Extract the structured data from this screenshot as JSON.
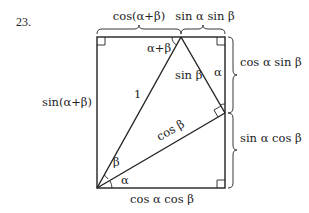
{
  "problem_number": "23.",
  "labels": {
    "top_left": "cos(α+β)",
    "top_right": "sin α sin β",
    "right_upper": "cos α sin β",
    "right_lower": "sin α cos β",
    "left": "sin(α+β)",
    "bottom": "cos α cos β",
    "hypotenuse": "1",
    "inner_side": "sin β",
    "inner_hyp": "cos β",
    "top_angle": "α+β",
    "right_angle_alpha": "α",
    "origin_beta": "β",
    "origin_alpha": "α"
  },
  "geometry": {
    "rect": {
      "x1": 97,
      "y1": 37,
      "x2": 225,
      "y2": 188
    },
    "top_vertex": {
      "x": 181,
      "y": 37
    },
    "right_vertex": {
      "x": 225,
      "y": 113
    },
    "origin": {
      "x": 97,
      "y": 188
    }
  }
}
